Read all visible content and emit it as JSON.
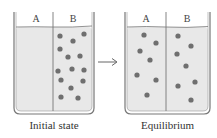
{
  "diagram": {
    "colors": {
      "liquid": "#e8e8e8",
      "dot": "#6f6f6f",
      "outline": "#777777",
      "text": "#333333"
    },
    "arrow": "→",
    "panels": [
      {
        "caption": "Initial state",
        "compartments": [
          {
            "label": "A",
            "dots": []
          },
          {
            "label": "B",
            "dots": [
              [
                60,
                36
              ],
              [
                84,
                34
              ],
              [
                73,
                41
              ],
              [
                60,
                49
              ],
              [
                68,
                57
              ],
              [
                80,
                56
              ],
              [
                58,
                71
              ],
              [
                72,
                69
              ],
              [
                84,
                70
              ],
              [
                61,
                80
              ],
              [
                83,
                81
              ],
              [
                71,
                88
              ],
              [
                61,
                97
              ],
              [
                78,
                98
              ]
            ]
          }
        ]
      },
      {
        "caption": "Equilibrium",
        "compartments": [
          {
            "label": "A",
            "dots": [
              [
                144,
                35
              ],
              [
                156,
                43
              ],
              [
                140,
                51
              ],
              [
                150,
                60
              ],
              [
                137,
                75
              ],
              [
                156,
                80
              ],
              [
                147,
                95
              ]
            ]
          },
          {
            "label": "B",
            "dots": [
              [
                178,
                36
              ],
              [
                191,
                46
              ],
              [
                177,
                54
              ],
              [
                186,
                66
              ],
              [
                178,
                86
              ],
              [
                195,
                82
              ],
              [
                191,
                100
              ]
            ]
          }
        ]
      }
    ]
  }
}
